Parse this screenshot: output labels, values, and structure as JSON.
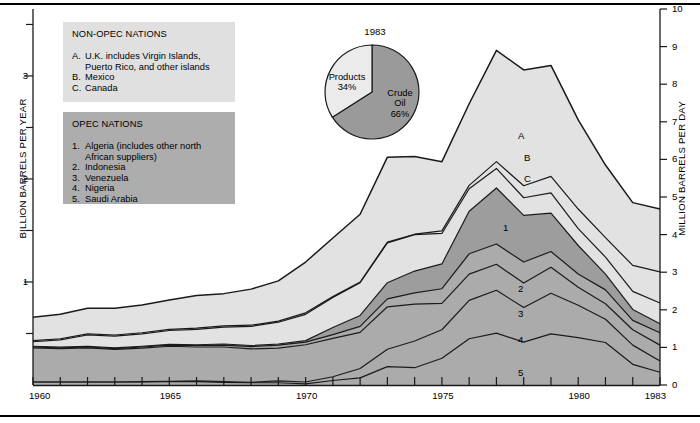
{
  "axes": {
    "left_title": "BILLION BARRELS PER YEAR",
    "right_title": "MILLION BARRELS PER DAY",
    "left_ticks": [
      "1",
      "2",
      "3"
    ],
    "right_ticks": [
      "0",
      "1",
      "2",
      "3",
      "4",
      "5",
      "6",
      "7",
      "8",
      "9",
      "10"
    ],
    "x_ticks": [
      "1960",
      "1965",
      "1970",
      "1975",
      "1980",
      "1983"
    ]
  },
  "legends": {
    "nonopec": {
      "title": "NON-OPEC NATIONS",
      "items": [
        {
          "marker": "A.",
          "text": "U.K. includes Virgin Islands,\nPuerto Rico, and other islands"
        },
        {
          "marker": "B.",
          "text": "Mexico"
        },
        {
          "marker": "C.",
          "text": "Canada"
        }
      ]
    },
    "opec": {
      "title": "OPEC NATIONS",
      "items": [
        {
          "marker": "1.",
          "text": "Algeria (includes other north\nAfrican suppliers)"
        },
        {
          "marker": "2.",
          "text": "Indonesia"
        },
        {
          "marker": "3.",
          "text": "Venezuela"
        },
        {
          "marker": "4.",
          "text": "Nigeria"
        },
        {
          "marker": "5.",
          "text": "Saudi Arabia"
        }
      ]
    }
  },
  "band_labels": [
    "A",
    "B",
    "C",
    "1",
    "2",
    "3",
    "4",
    "5"
  ],
  "pie": {
    "year": "1983",
    "slices": [
      {
        "label": "Crude\nOil",
        "pct_label": "66%",
        "value": 66,
        "color": "#9a9a9a"
      },
      {
        "label": "Products",
        "pct_label": "34%",
        "value": 34,
        "color": "#ebebeb"
      }
    ]
  },
  "colors": {
    "nonopec_fill": "#e2e2e2",
    "opec_fill": "#ababab",
    "opec_fill_top": "#9d9d9d",
    "outline": "#1a1a1a",
    "legend_nonopec_bg": "#e0e0e0",
    "legend_opec_bg": "#adadad"
  },
  "chart_data": {
    "type": "area",
    "title": "",
    "subtitle": "",
    "xlabel": "",
    "ylabel": "BILLION BARRELS PER YEAR",
    "y2label": "MILLION BARRELS PER DAY",
    "ylim": [
      0,
      3.65
    ],
    "y2lim": [
      0,
      10
    ],
    "xlim": [
      1960,
      1983
    ],
    "grid": false,
    "legend_position": "upper-left",
    "stacked": true,
    "stack_order_bottom_to_top": [
      "5",
      "4",
      "3",
      "2",
      "1",
      "C",
      "B",
      "A"
    ],
    "units": "million barrels per day",
    "x": [
      1960,
      1961,
      1962,
      1963,
      1964,
      1965,
      1966,
      1967,
      1968,
      1969,
      1970,
      1971,
      1972,
      1973,
      1974,
      1975,
      1976,
      1977,
      1978,
      1979,
      1980,
      1981,
      1982,
      1983
    ],
    "series": [
      {
        "name": "5",
        "legend": "Saudi Arabia",
        "group": "OPEC",
        "values": [
          0.08,
          0.08,
          0.08,
          0.08,
          0.08,
          0.09,
          0.09,
          0.07,
          0.06,
          0.06,
          0.03,
          0.12,
          0.19,
          0.49,
          0.46,
          0.71,
          1.23,
          1.38,
          1.14,
          1.36,
          1.26,
          1.13,
          0.55,
          0.34
        ]
      },
      {
        "name": "4",
        "legend": "Nigeria",
        "group": "OPEC",
        "values": [
          0.0,
          0.0,
          0.0,
          0.0,
          0.01,
          0.01,
          0.02,
          0.02,
          0.01,
          0.05,
          0.05,
          0.1,
          0.25,
          0.46,
          0.71,
          0.76,
          1.02,
          1.14,
          0.92,
          1.08,
          0.86,
          0.62,
          0.51,
          0.3
        ]
      },
      {
        "name": "3",
        "legend": "Venezuela",
        "group": "OPEC",
        "values": [
          0.91,
          0.89,
          0.91,
          0.87,
          0.89,
          0.93,
          0.9,
          0.92,
          0.89,
          0.87,
          0.99,
          1.02,
          0.96,
          1.13,
          0.98,
          0.7,
          0.7,
          0.69,
          0.65,
          0.69,
          0.48,
          0.41,
          0.41,
          0.42
        ]
      },
      {
        "name": "2",
        "legend": "Indonesia",
        "group": "OPEC",
        "values": [
          0.02,
          0.02,
          0.02,
          0.02,
          0.03,
          0.03,
          0.04,
          0.05,
          0.06,
          0.08,
          0.07,
          0.1,
          0.16,
          0.21,
          0.3,
          0.39,
          0.54,
          0.54,
          0.56,
          0.42,
          0.35,
          0.37,
          0.25,
          0.33
        ]
      },
      {
        "name": "1",
        "legend": "Algeria and other north African suppliers",
        "group": "OPEC",
        "values": [
          0.02,
          0.02,
          0.02,
          0.02,
          0.02,
          0.02,
          0.02,
          0.03,
          0.03,
          0.03,
          0.04,
          0.19,
          0.29,
          0.43,
          0.58,
          0.66,
          1.13,
          1.49,
          1.24,
          1.02,
          0.76,
          0.42,
          0.29,
          0.24
        ]
      },
      {
        "name": "C",
        "legend": "Canada",
        "group": "NON-OPEC",
        "values": [
          0.12,
          0.19,
          0.3,
          0.31,
          0.33,
          0.37,
          0.41,
          0.45,
          0.51,
          0.58,
          0.7,
          0.8,
          0.87,
          1.06,
          0.97,
          0.81,
          0.6,
          0.52,
          0.47,
          0.54,
          0.45,
          0.45,
          0.48,
          0.55
        ]
      },
      {
        "name": "B",
        "legend": "Mexico",
        "group": "NON-OPEC",
        "values": [
          0.03,
          0.03,
          0.03,
          0.03,
          0.03,
          0.03,
          0.03,
          0.03,
          0.03,
          0.03,
          0.04,
          0.02,
          0.02,
          0.02,
          0.01,
          0.07,
          0.09,
          0.18,
          0.32,
          0.44,
          0.52,
          0.52,
          0.69,
          0.83
        ]
      },
      {
        "name": "A",
        "legend": "U.K. includes Virgin Islands, Puerto Rico, and other islands",
        "group": "NON-OPEC",
        "values": [
          0.62,
          0.65,
          0.68,
          0.71,
          0.74,
          0.78,
          0.87,
          0.86,
          0.96,
          1.07,
          1.35,
          1.56,
          1.8,
          2.26,
          2.07,
          1.84,
          2.17,
          2.96,
          3.08,
          2.95,
          2.37,
          1.93,
          1.67,
          1.67
        ]
      }
    ],
    "totals": [
      1.8,
      1.88,
      2.04,
      2.04,
      2.13,
      2.26,
      2.38,
      2.43,
      2.55,
      2.77,
      3.27,
      3.91,
      4.54,
      6.06,
      6.08,
      5.94,
      7.48,
      8.9,
      8.38,
      8.5,
      7.05,
      5.85,
      4.85,
      4.68
    ],
    "pie": {
      "type": "pie",
      "title": "1983",
      "categories": [
        "Crude Oil",
        "Products"
      ],
      "values": [
        66,
        34
      ],
      "value_labels": [
        "66%",
        "34%"
      ]
    }
  }
}
